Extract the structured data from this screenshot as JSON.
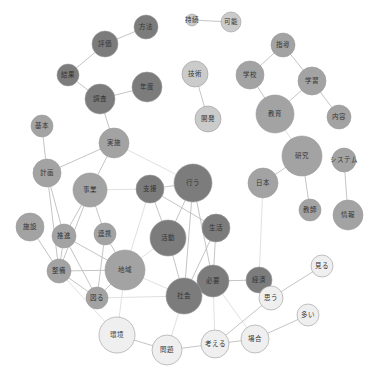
{
  "title": "",
  "colors": {
    "dark": "#7c7c7c",
    "medium": "#a3a3a3",
    "light_medium": "#cbcbcb",
    "light": "#efefef",
    "edge": "#bdbdbd"
  },
  "nodes": [
    {
      "id": "jizoku",
      "label": "持続",
      "x": 192,
      "y": 20,
      "r": 6,
      "tone": "light_medium"
    },
    {
      "id": "kanou",
      "label": "可能",
      "x": 231,
      "y": 22,
      "r": 10,
      "tone": "light_medium"
    },
    {
      "id": "houhou",
      "label": "方法",
      "x": 146,
      "y": 27,
      "r": 12,
      "tone": "dark"
    },
    {
      "id": "hyouka",
      "label": "評価",
      "x": 105,
      "y": 44,
      "r": 13,
      "tone": "dark"
    },
    {
      "id": "kekka",
      "label": "結果",
      "x": 68,
      "y": 75,
      "r": 11,
      "tone": "dark"
    },
    {
      "id": "chousa",
      "label": "調査",
      "x": 100,
      "y": 99,
      "r": 15,
      "tone": "dark"
    },
    {
      "id": "nendo",
      "label": "年度",
      "x": 147,
      "y": 87,
      "r": 15,
      "tone": "dark"
    },
    {
      "id": "gijutsu",
      "label": "技術",
      "x": 195,
      "y": 74,
      "r": 13,
      "tone": "light_medium"
    },
    {
      "id": "kaihatsu",
      "label": "開発",
      "x": 208,
      "y": 119,
      "r": 13,
      "tone": "light_medium"
    },
    {
      "id": "shidou",
      "label": "指導",
      "x": 283,
      "y": 45,
      "r": 12,
      "tone": "medium"
    },
    {
      "id": "gakkou",
      "label": "学校",
      "x": 250,
      "y": 75,
      "r": 14,
      "tone": "medium"
    },
    {
      "id": "gakushuu",
      "label": "学習",
      "x": 312,
      "y": 81,
      "r": 14,
      "tone": "medium"
    },
    {
      "id": "kyouiku",
      "label": "教育",
      "x": 275,
      "y": 114,
      "r": 19,
      "tone": "medium"
    },
    {
      "id": "naiyou",
      "label": "内容",
      "x": 339,
      "y": 117,
      "r": 12,
      "tone": "medium"
    },
    {
      "id": "kenkyuu",
      "label": "研究",
      "x": 302,
      "y": 156,
      "r": 20,
      "tone": "medium"
    },
    {
      "id": "system",
      "label": "システム",
      "x": 344,
      "y": 160,
      "r": 12,
      "tone": "medium"
    },
    {
      "id": "nihon",
      "label": "日本",
      "x": 263,
      "y": 183,
      "r": 15,
      "tone": "medium"
    },
    {
      "id": "kyoushi",
      "label": "教師",
      "x": 310,
      "y": 210,
      "r": 11,
      "tone": "medium"
    },
    {
      "id": "jouhou",
      "label": "情報",
      "x": 348,
      "y": 215,
      "r": 15,
      "tone": "medium"
    },
    {
      "id": "kihon",
      "label": "基本",
      "x": 42,
      "y": 126,
      "r": 11,
      "tone": "medium"
    },
    {
      "id": "jisshi",
      "label": "実施",
      "x": 114,
      "y": 143,
      "r": 15,
      "tone": "medium"
    },
    {
      "id": "keikaku",
      "label": "計画",
      "x": 47,
      "y": 173,
      "r": 14,
      "tone": "medium"
    },
    {
      "id": "jigyou",
      "label": "事業",
      "x": 90,
      "y": 190,
      "r": 17,
      "tone": "medium"
    },
    {
      "id": "shien",
      "label": "支援",
      "x": 150,
      "y": 189,
      "r": 14,
      "tone": "dark"
    },
    {
      "id": "okonau",
      "label": "行う",
      "x": 193,
      "y": 183,
      "r": 19,
      "tone": "dark"
    },
    {
      "id": "seikatsu",
      "label": "生活",
      "x": 216,
      "y": 228,
      "r": 14,
      "tone": "dark"
    },
    {
      "id": "shisetsu",
      "label": "施設",
      "x": 30,
      "y": 227,
      "r": 14,
      "tone": "medium"
    },
    {
      "id": "suishin",
      "label": "推進",
      "x": 64,
      "y": 236,
      "r": 12,
      "tone": "medium"
    },
    {
      "id": "renkei",
      "label": "連携",
      "x": 105,
      "y": 234,
      "r": 11,
      "tone": "medium"
    },
    {
      "id": "katsudou",
      "label": "活動",
      "x": 168,
      "y": 238,
      "r": 18,
      "tone": "dark"
    },
    {
      "id": "chiiki",
      "label": "地域",
      "x": 125,
      "y": 270,
      "r": 20,
      "tone": "medium"
    },
    {
      "id": "keizai",
      "label": "経済",
      "x": 259,
      "y": 280,
      "r": 13,
      "tone": "dark"
    },
    {
      "id": "seibi",
      "label": "整備",
      "x": 59,
      "y": 271,
      "r": 12,
      "tone": "medium"
    },
    {
      "id": "hakaru",
      "label": "図る",
      "x": 97,
      "y": 298,
      "r": 11,
      "tone": "medium"
    },
    {
      "id": "hitsuyou",
      "label": "必要",
      "x": 213,
      "y": 281,
      "r": 16,
      "tone": "dark"
    },
    {
      "id": "shakai",
      "label": "社会",
      "x": 184,
      "y": 296,
      "r": 18,
      "tone": "dark"
    },
    {
      "id": "miru",
      "label": "見る",
      "x": 322,
      "y": 266,
      "r": 11,
      "tone": "light"
    },
    {
      "id": "omou",
      "label": "思う",
      "x": 271,
      "y": 298,
      "r": 12,
      "tone": "light"
    },
    {
      "id": "ooi",
      "label": "多い",
      "x": 308,
      "y": 315,
      "r": 11,
      "tone": "light"
    },
    {
      "id": "kankyou",
      "label": "環境",
      "x": 117,
      "y": 335,
      "r": 18,
      "tone": "light"
    },
    {
      "id": "baai",
      "label": "場合",
      "x": 255,
      "y": 339,
      "r": 14,
      "tone": "light"
    },
    {
      "id": "kangaeru",
      "label": "考える",
      "x": 215,
      "y": 344,
      "r": 14,
      "tone": "light"
    },
    {
      "id": "mondai",
      "label": "問題",
      "x": 167,
      "y": 350,
      "r": 15,
      "tone": "light"
    }
  ],
  "edges": [
    [
      "jizoku",
      "kanou",
      0
    ],
    [
      "houhou",
      "hyouka",
      0
    ],
    [
      "hyouka",
      "kekka",
      0
    ],
    [
      "kekka",
      "chousa",
      0
    ],
    [
      "chousa",
      "nendo",
      0
    ],
    [
      "chousa",
      "jisshi",
      0
    ],
    [
      "gijutsu",
      "kaihatsu",
      0
    ],
    [
      "shidou",
      "gakkou",
      0
    ],
    [
      "shidou",
      "gakushuu",
      0
    ],
    [
      "gakkou",
      "kyouiku",
      0
    ],
    [
      "gakushuu",
      "kyouiku",
      0
    ],
    [
      "gakushuu",
      "naiyou",
      0
    ],
    [
      "kyouiku",
      "kenkyuu",
      1
    ],
    [
      "kenkyuu",
      "nihon",
      0
    ],
    [
      "kenkyuu",
      "kyoushi",
      0
    ],
    [
      "system",
      "jouhou",
      0
    ],
    [
      "nihon",
      "keizai",
      1
    ],
    [
      "kihon",
      "keikaku",
      0
    ],
    [
      "jisshi",
      "keikaku",
      0
    ],
    [
      "jisshi",
      "jigyou",
      0
    ],
    [
      "jisshi",
      "okonau",
      1
    ],
    [
      "jigyou",
      "shien",
      1
    ],
    [
      "jigyou",
      "suishin",
      0
    ],
    [
      "jigyou",
      "renkei",
      0
    ],
    [
      "jigyou",
      "seibi",
      0
    ],
    [
      "keikaku",
      "suishin",
      0
    ],
    [
      "keikaku",
      "seibi",
      0
    ],
    [
      "shien",
      "okonau",
      0
    ],
    [
      "shien",
      "katsudou",
      0
    ],
    [
      "shien",
      "seikatsu",
      0
    ],
    [
      "shien",
      "chiiki",
      1
    ],
    [
      "okonau",
      "katsudou",
      0
    ],
    [
      "okonau",
      "hitsuyou",
      0
    ],
    [
      "okonau",
      "shakai",
      0
    ],
    [
      "seikatsu",
      "hitsuyou",
      0
    ],
    [
      "seikatsu",
      "shakai",
      0
    ],
    [
      "shisetsu",
      "seibi",
      0
    ],
    [
      "suishin",
      "seibi",
      0
    ],
    [
      "suishin",
      "chiiki",
      0
    ],
    [
      "suishin",
      "hakaru",
      0
    ],
    [
      "renkei",
      "chiiki",
      0
    ],
    [
      "renkei",
      "hakaru",
      0
    ],
    [
      "katsudou",
      "shakai",
      0
    ],
    [
      "katsudou",
      "chiiki",
      1
    ],
    [
      "chiiki",
      "seibi",
      0
    ],
    [
      "chiiki",
      "hakaru",
      0
    ],
    [
      "chiiki",
      "shakai",
      1
    ],
    [
      "chiiki",
      "kankyou",
      1
    ],
    [
      "seibi",
      "hakaru",
      0
    ],
    [
      "seibi",
      "kankyou",
      1
    ],
    [
      "keizai",
      "hitsuyou",
      0
    ],
    [
      "hitsuyou",
      "shakai",
      0
    ],
    [
      "hitsuyou",
      "kangaeru",
      1
    ],
    [
      "hitsuyou",
      "baai",
      1
    ],
    [
      "shakai",
      "mondai",
      1
    ],
    [
      "shakai",
      "hakaru",
      1
    ],
    [
      "kankyou",
      "mondai",
      0
    ],
    [
      "mondai",
      "kangaeru",
      0
    ],
    [
      "kangaeru",
      "baai",
      0
    ],
    [
      "kangaeru",
      "omou",
      0
    ],
    [
      "omou",
      "miru",
      0
    ],
    [
      "baai",
      "ooi",
      0
    ]
  ]
}
